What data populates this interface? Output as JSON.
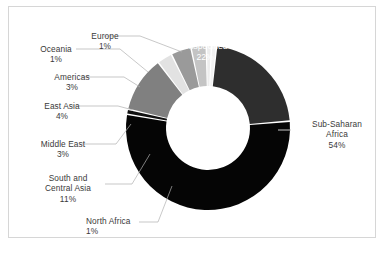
{
  "figure": {
    "background_color": "#ffffff",
    "border_color": "#d6d6d6",
    "label_color": "#3a3a3a",
    "inner_label_color": "#ffffff",
    "leader_line_color": "#b0b0b0"
  },
  "chart_data": {
    "type": "pie",
    "variant": "donut",
    "title": "",
    "subtitle": "",
    "xlabel": "",
    "ylabel": "",
    "legend_position": "none",
    "grid": false,
    "total_percent": 100,
    "value_suffix": "%",
    "center_x": 208,
    "center_y": 128,
    "outer_radius": 82,
    "inner_radius": 42,
    "start_angle_deg": -84,
    "categories": [
      "Unspecified",
      "Sub-Saharan Africa",
      "North Africa",
      "South and Central Asia",
      "Middle East",
      "East Asia",
      "Americas",
      "Oceania",
      "Europe"
    ],
    "values": [
      22,
      54,
      1,
      11,
      3,
      4,
      3,
      1,
      1
    ],
    "colors": [
      "#2e2e2e",
      "#050505",
      "#111111",
      "#808080",
      "#e2e2e2",
      "#9a9a9a",
      "#c4c4c4",
      "#ededed",
      "#f2f2f2"
    ],
    "slices": [
      {
        "label": "Unspecified",
        "value": 22,
        "value_text": "22%",
        "color": "#2e2e2e",
        "label_placement": "inside"
      },
      {
        "label": "Sub-Saharan Africa",
        "value": 54,
        "value_text": "54%",
        "color": "#050505",
        "label_placement": "outside-right"
      },
      {
        "label": "North Africa",
        "value": 1,
        "value_text": "1%",
        "color": "#111111",
        "label_placement": "outside-bottom"
      },
      {
        "label": "South and Central Asia",
        "value": 11,
        "value_text": "11%",
        "color": "#808080",
        "label_placement": "outside-left"
      },
      {
        "label": "Middle East",
        "value": 3,
        "value_text": "3%",
        "color": "#e2e2e2",
        "label_placement": "outside-left"
      },
      {
        "label": "East Asia",
        "value": 4,
        "value_text": "4%",
        "color": "#9a9a9a",
        "label_placement": "outside-left"
      },
      {
        "label": "Americas",
        "value": 3,
        "value_text": "3%",
        "color": "#c4c4c4",
        "label_placement": "outside-left"
      },
      {
        "label": "Oceania",
        "value": 1,
        "value_text": "1%",
        "color": "#ededed",
        "label_placement": "outside-left"
      },
      {
        "label": "Europe",
        "value": 1,
        "value_text": "1%",
        "color": "#f2f2f2",
        "label_placement": "outside-top"
      }
    ]
  },
  "labels": {
    "unspecified": {
      "name": "Unspecified",
      "value": "22%"
    },
    "subsaharan": {
      "name_line1": "Sub-Saharan",
      "name_line2": "Africa",
      "value": "54%"
    },
    "northafrica": {
      "name": "North Africa",
      "value": "1%"
    },
    "southcentral": {
      "name_line1": "South and",
      "name_line2": "Central Asia",
      "value": "11%"
    },
    "middleeast": {
      "name": "Middle East",
      "value": "3%"
    },
    "eastasia": {
      "name": "East Asia",
      "value": "4%"
    },
    "americas": {
      "name": "Americas",
      "value": "3%"
    },
    "oceania": {
      "name": "Oceania",
      "value": "1%"
    },
    "europe": {
      "name": "Europe",
      "value": "1%"
    }
  }
}
